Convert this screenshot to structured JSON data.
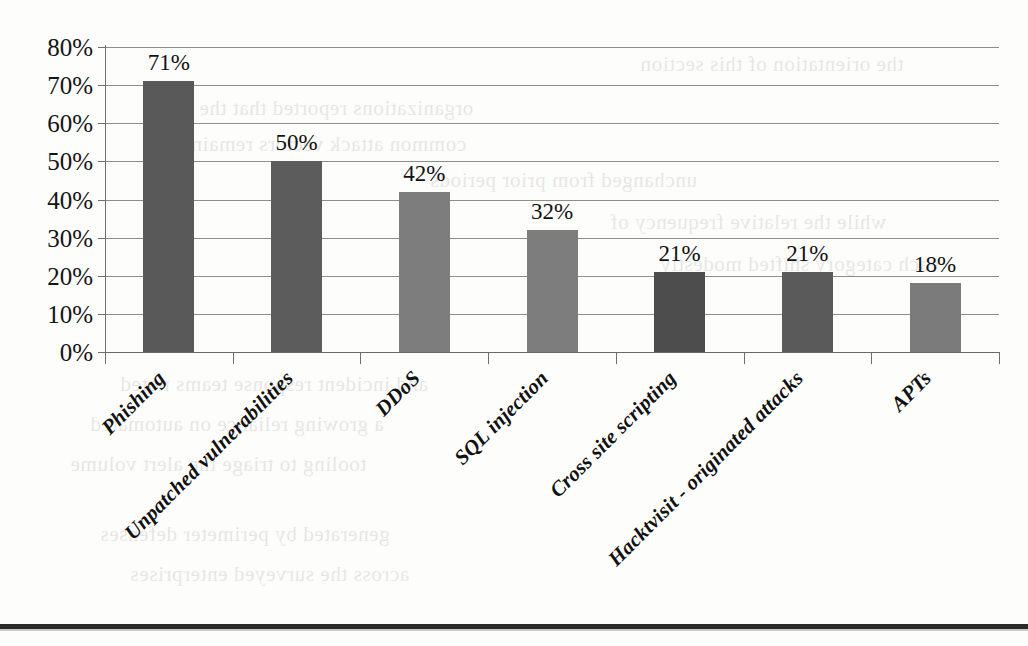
{
  "chart_data": {
    "type": "bar",
    "title": "",
    "subtitle": "",
    "xlabel": "",
    "ylabel": "",
    "ylim": [
      0,
      80
    ],
    "ytick_step": 10,
    "grid": true,
    "legend": "none",
    "value_labels": true,
    "categories": [
      "Phishing",
      "Unpatched vulnerabilities",
      "DDoS",
      "SQL injection",
      "Cross site scripting",
      "Hacktvisit - originated attacks",
      "APTs"
    ],
    "values": [
      71,
      50,
      42,
      32,
      21,
      21,
      18
    ],
    "value_labels_text": [
      "71%",
      "50%",
      "42%",
      "32%",
      "21%",
      "21%",
      "18%"
    ],
    "ytick_labels": [
      "0%",
      "10%",
      "20%",
      "30%",
      "40%",
      "50%",
      "60%",
      "70%",
      "80%"
    ],
    "bar_colors": [
      "#595959",
      "#5c5c5c",
      "#7d7d7d",
      "#7d7d7d",
      "#4d4d4d",
      "#5a5a5a",
      "#7b7b7b"
    ]
  },
  "ghost_text": {
    "lines": [
      "the orientation of this section",
      "organizations reported that the most",
      "common attack vectors remained",
      "unchanged from prior periods",
      "while the relative frequency of",
      "each category shifted modestly",
      "and incident response teams noted",
      "a growing reliance on automated",
      "tooling to triage the alert volume",
      "generated by perimeter defenses",
      "across the surveyed enterprises"
    ]
  },
  "page": {
    "bottom_rule_visible": "true"
  }
}
